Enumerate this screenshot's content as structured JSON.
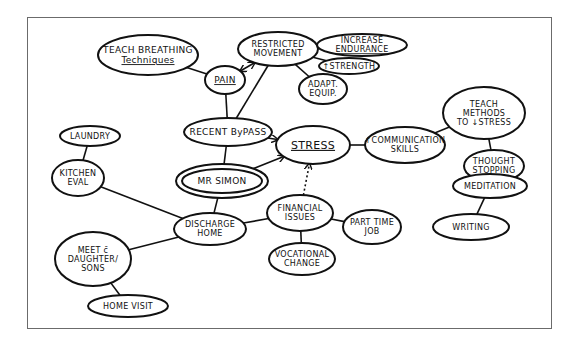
{
  "diagram": {
    "type": "hand-drawn concept map",
    "stroke_color": "#111111",
    "frame_color": "#6b6b6b",
    "nodes": [
      {
        "id": "teach-breathing",
        "lines": [
          "TEACH BREATHING",
          "Techniques"
        ],
        "underline": true
      },
      {
        "id": "pain",
        "lines": [
          "PAIN"
        ],
        "underline": true
      },
      {
        "id": "restricted-movement",
        "lines": [
          "RESTRICTED",
          "MOVEMENT"
        ]
      },
      {
        "id": "increase-endurance",
        "lines": [
          "INCREASE",
          "ENDURANCE"
        ],
        "underline": true
      },
      {
        "id": "strength",
        "lines": [
          "↑STRENGTH"
        ]
      },
      {
        "id": "adapt-equip",
        "lines": [
          "ADAPT.",
          "EQUIP."
        ]
      },
      {
        "id": "recent-bypass",
        "lines": [
          "RECENT ByPASS"
        ]
      },
      {
        "id": "stress",
        "lines": [
          "STRESS"
        ],
        "underline": true
      },
      {
        "id": "communication-skills",
        "lines": [
          "↑COMMUNICATION",
          "SKILLS"
        ]
      },
      {
        "id": "teach-methods",
        "lines": [
          "TEACH",
          "METHODS",
          "TO ↓STRESS"
        ]
      },
      {
        "id": "thought-stopping",
        "lines": [
          "THOUGHT",
          "STOPPING"
        ]
      },
      {
        "id": "meditation",
        "lines": [
          "MEDITATION"
        ]
      },
      {
        "id": "writing",
        "lines": [
          "WRITING"
        ]
      },
      {
        "id": "mr-simon",
        "lines": [
          "MR SIMON"
        ],
        "double_border": true
      },
      {
        "id": "laundry",
        "lines": [
          "LAUNDRY"
        ]
      },
      {
        "id": "kitchen-eval",
        "lines": [
          "KITCHEN",
          "EVAL"
        ]
      },
      {
        "id": "discharge-home",
        "lines": [
          "DISCHARGE",
          "HOME"
        ]
      },
      {
        "id": "financial-issues",
        "lines": [
          "FINANCIAL",
          "ISSUES"
        ]
      },
      {
        "id": "part-time-job",
        "lines": [
          "PART TIME",
          "JOB"
        ]
      },
      {
        "id": "vocational-change",
        "lines": [
          "VOCATIONAL",
          "CHANGE"
        ]
      },
      {
        "id": "meet-daughter-sons",
        "lines": [
          "MEET c̄",
          "DAUGHTER/",
          "SONS"
        ]
      },
      {
        "id": "home-visit",
        "lines": [
          "HOME VISIT"
        ]
      }
    ],
    "edges": [
      {
        "from": "teach-breathing",
        "to": "pain"
      },
      {
        "from": "pain",
        "to": "restricted-movement",
        "arrow": "both"
      },
      {
        "from": "restricted-movement",
        "to": "increase-endurance"
      },
      {
        "from": "restricted-movement",
        "to": "strength"
      },
      {
        "from": "restricted-movement",
        "to": "adapt-equip"
      },
      {
        "from": "pain",
        "to": "recent-bypass"
      },
      {
        "from": "restricted-movement",
        "to": "recent-bypass"
      },
      {
        "from": "recent-bypass",
        "to": "stress",
        "arrow": "end"
      },
      {
        "from": "recent-bypass",
        "to": "mr-simon"
      },
      {
        "from": "mr-simon",
        "to": "stress",
        "arrow": "end"
      },
      {
        "from": "financial-issues",
        "to": "stress",
        "arrow": "end",
        "dashed": true
      },
      {
        "from": "stress",
        "to": "communication-skills"
      },
      {
        "from": "communication-skills",
        "to": "teach-methods"
      },
      {
        "from": "teach-methods",
        "to": "thought-stopping"
      },
      {
        "from": "thought-stopping",
        "to": "meditation",
        "arrow": "end"
      },
      {
        "from": "meditation",
        "to": "writing"
      },
      {
        "from": "mr-simon",
        "to": "discharge-home"
      },
      {
        "from": "discharge-home",
        "to": "kitchen-eval"
      },
      {
        "from": "kitchen-eval",
        "to": "laundry"
      },
      {
        "from": "discharge-home",
        "to": "financial-issues"
      },
      {
        "from": "financial-issues",
        "to": "part-time-job"
      },
      {
        "from": "financial-issues",
        "to": "vocational-change"
      },
      {
        "from": "discharge-home",
        "to": "meet-daughter-sons"
      },
      {
        "from": "meet-daughter-sons",
        "to": "home-visit"
      }
    ]
  }
}
